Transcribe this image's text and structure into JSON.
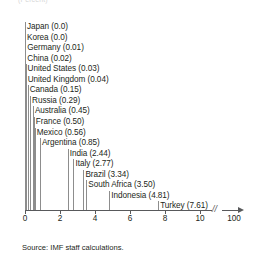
{
  "figure": {
    "subtitle": "(Percent)",
    "source": "Source: IMF staff calculations."
  },
  "chart_data": {
    "type": "bar",
    "orientation": "vertical-stems",
    "title": "",
    "subtitle": "(Percent)",
    "xlabel": "",
    "ylabel": "",
    "xlim": [
      0,
      10
    ],
    "grid": false,
    "legend": false,
    "axis_break": {
      "symbol": "//",
      "after_tick": 10,
      "final_tick": "100"
    },
    "xticks": [
      0,
      2,
      4,
      6,
      8,
      10,
      100
    ],
    "xtick_labels": [
      "0",
      "2",
      "4",
      "6",
      "8",
      "10",
      "100"
    ],
    "categories": [
      "Japan",
      "Korea",
      "Germany",
      "China",
      "United States",
      "United Kingdom",
      "Canada",
      "Russia",
      "Australia",
      "France",
      "Mexico",
      "Argentina",
      "India",
      "Italy",
      "Brazil",
      "South Africa",
      "Indonesia",
      "Turkey"
    ],
    "values": [
      0.0,
      0.0,
      0.01,
      0.02,
      0.03,
      0.04,
      0.15,
      0.29,
      0.45,
      0.5,
      0.56,
      0.85,
      2.44,
      2.77,
      3.34,
      3.5,
      4.81,
      7.61
    ],
    "labels": [
      "Japan (0.0)",
      "Korea (0.0)",
      "Germany (0.01)",
      "China (0.02)",
      "United States (0.03)",
      "United Kingdom (0.04)",
      "Canada (0.15)",
      "Russia (0.29)",
      "Australia (0.45)",
      "France (0.50)",
      "Mexico (0.56)",
      "Argentina (0.85)",
      "India (2.44)",
      "Italy (2.77)",
      "Brazil (3.34)",
      "South Africa (3.50)",
      "Indonesia (4.81)",
      "Turkey (7.61)"
    ]
  }
}
